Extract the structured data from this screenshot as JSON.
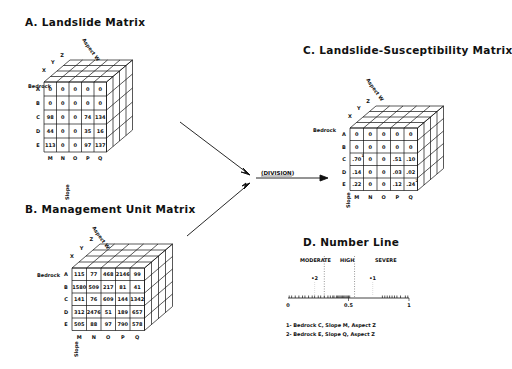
{
  "matrices": {
    "A": {
      "title": "A. Landslide Matrix",
      "aspect_axis": "Aspect W",
      "aspect_labels": [
        "X",
        "Y",
        "Z"
      ],
      "bedrock_axis": "Bedrock",
      "bedrock_labels": [
        "A",
        "B",
        "C",
        "D",
        "E"
      ],
      "slope_axis": "Slope",
      "slope_labels": [
        "M",
        "N",
        "O",
        "P",
        "Q"
      ],
      "front_face": [
        [
          "0",
          "0",
          "0",
          "0",
          "0"
        ],
        [
          "0",
          "0",
          "0",
          "0",
          "0"
        ],
        [
          "98",
          "0",
          "0",
          "74",
          "134"
        ],
        [
          "44",
          "0",
          "0",
          "35",
          "16"
        ],
        [
          "113",
          "0",
          "0",
          "97",
          "137"
        ]
      ]
    },
    "B": {
      "title": "B. Management Unit Matrix",
      "aspect_axis": "Aspect W",
      "aspect_labels": [
        "X",
        "Y",
        "Z"
      ],
      "bedrock_axis": "Bedrock",
      "bedrock_labels": [
        "A",
        "B",
        "C",
        "D",
        "E"
      ],
      "slope_axis": "Slope",
      "slope_labels": [
        "M",
        "N",
        "O",
        "P",
        "Q"
      ],
      "front_face": [
        [
          "115",
          "77",
          "468",
          "2146",
          "99"
        ],
        [
          "1580",
          "509",
          "217",
          "81",
          "41"
        ],
        [
          "141",
          "76",
          "609",
          "144",
          "1342"
        ],
        [
          "312",
          "2476",
          "51",
          "189",
          "657"
        ],
        [
          "505",
          "88",
          "97",
          "790",
          "578"
        ]
      ]
    },
    "C": {
      "title": "C. Landslide-Susceptibility Matrix",
      "aspect_axis": "Aspect W",
      "aspect_labels": [
        "X",
        "Y",
        "Z"
      ],
      "bedrock_axis": "Bedrock",
      "bedrock_labels": [
        "A",
        "B",
        "C",
        "D",
        "E"
      ],
      "slope_axis": "Slope",
      "slope_labels": [
        "M",
        "N",
        "O",
        "P",
        "Q"
      ],
      "front_face": [
        [
          "0",
          "0",
          "0",
          "0",
          "0"
        ],
        [
          "0",
          "0",
          "0",
          "0",
          "0"
        ],
        [
          ".70",
          "0",
          "0",
          ".51",
          ".10"
        ],
        [
          ".14",
          "0",
          "0",
          ".03",
          ".02"
        ],
        [
          ".22",
          "0",
          "0",
          ".12",
          ".24"
        ]
      ],
      "markers": [
        {
          "row": 2,
          "col": 0,
          "label": "1"
        },
        {
          "row": 4,
          "col": 4,
          "label": "2"
        }
      ]
    }
  },
  "operation": {
    "label": "(DIVISION)"
  },
  "number_line": {
    "title": "D. Number Line",
    "zones": [
      "MODERATE",
      "HIGH",
      "SEVERE"
    ],
    "ticks": [
      "0",
      "0.5",
      "1"
    ],
    "markers": [
      {
        "label": "2",
        "value": 0.22
      },
      {
        "label": "1",
        "value": 0.7
      }
    ],
    "legend": [
      "1- Bedrock C, Slope M, Aspect Z",
      "2- Bedrock E, Slope Q, Aspect Z"
    ]
  }
}
